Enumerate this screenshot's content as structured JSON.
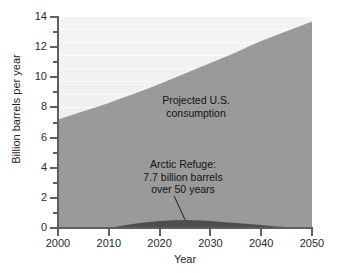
{
  "chart_data": {
    "type": "area",
    "title": "",
    "subtitle": "",
    "xlabel": "Year",
    "ylabel": "Billion barrels per year",
    "xlim": [
      2000,
      2050
    ],
    "ylim": [
      0,
      14
    ],
    "grid": true,
    "legend_position": "none",
    "x_ticks": [
      "2000",
      "2010",
      "2020",
      "2030",
      "2040",
      "2050"
    ],
    "x_tick_values": [
      2000,
      2010,
      2020,
      2030,
      2040,
      2050
    ],
    "y_ticks": [
      "0",
      "2",
      "4",
      "6",
      "8",
      "10",
      "12",
      "14"
    ],
    "y_tick_values": [
      0,
      2,
      4,
      6,
      8,
      10,
      12,
      14
    ],
    "y_minor_tick_values": [
      1,
      3,
      5,
      7,
      9,
      11,
      13
    ],
    "x": [
      2000,
      2005,
      2010,
      2015,
      2020,
      2025,
      2030,
      2035,
      2040,
      2045,
      2050
    ],
    "series": [
      {
        "name": "Projected U.S. consumption",
        "values": [
          7.2,
          7.75,
          8.3,
          8.9,
          9.55,
          10.25,
          10.95,
          11.65,
          12.4,
          13.05,
          13.7
        ],
        "color": "#9a9a9a"
      },
      {
        "name": "Arctic Refuge production",
        "values": [
          0.0,
          0.0,
          0.02,
          0.28,
          0.46,
          0.53,
          0.47,
          0.34,
          0.2,
          0.06,
          0.0
        ],
        "color": "#4e4e4e"
      }
    ],
    "annotations": [
      {
        "id": "consumption-label",
        "text": "Projected U.S.\nconsumption",
        "x": 2025,
        "y": 9.0
      },
      {
        "id": "arctic-label",
        "text": "Arctic Refuge:\n7.7 billion barrels\nover 50 years",
        "x": 2022,
        "y": 4.5,
        "leader_to_x": 2025,
        "leader_to_y": 0.55
      }
    ],
    "colors": {
      "plot_background": "#f1f1f1",
      "consumption_area": "#9a9a9a",
      "arctic_area": "#4e4e4e",
      "axis": "#5f5f5f",
      "text": "#1f1f1f",
      "page_background": "#ffffff"
    }
  }
}
